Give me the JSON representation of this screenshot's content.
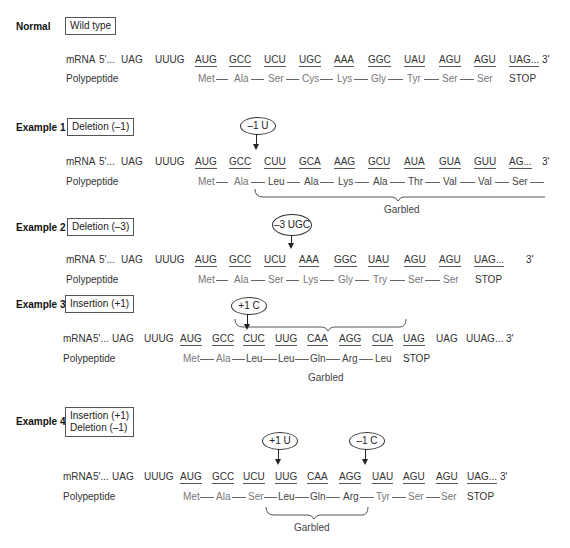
{
  "sections": {
    "normal": {
      "label": "Normal",
      "type": "Wild type",
      "mrna_label": "mRNA",
      "five_prime": "5'...",
      "pre": [
        "UAG",
        "UUUG"
      ],
      "codons": [
        "AUG",
        "GCC",
        "UCU",
        "UGC",
        "AAA",
        "GGC",
        "UAU",
        "AGU",
        "AGU",
        "UAG..."
      ],
      "three_prime": "3'",
      "peptide_label": "Polypeptide",
      "amino_acids": [
        "Met",
        "Ala",
        "Ser",
        "Cys",
        "Lys",
        "Gly",
        "Tyr",
        "Ser",
        "Ser"
      ],
      "stop": "STOP"
    },
    "example1": {
      "label": "Example 1",
      "type": "Deletion (–1)",
      "mutation": "–1 U",
      "mrna_label": "mRNA",
      "five_prime": "5'...",
      "pre": [
        "UAG",
        "UUUG"
      ],
      "codons": [
        "AUG",
        "GCC",
        "CUU",
        "GCA",
        "AAG",
        "GCU",
        "AUA",
        "GUA",
        "GUU",
        "AG..."
      ],
      "three_prime": "3'",
      "peptide_label": "Polypeptide",
      "amino_acids": [
        "Met",
        "Ala",
        "Leu",
        "Ala",
        "Lys",
        "Ala",
        "Thr",
        "Val",
        "Val",
        "Ser"
      ],
      "garbled": "Garbled"
    },
    "example2": {
      "label": "Example 2",
      "type": "Deletion (–3)",
      "mutation": "–3 UGC",
      "mrna_label": "mRNA",
      "five_prime": "5'...",
      "pre": [
        "UAG",
        "UUUG"
      ],
      "codons": [
        "AUG",
        "GCC",
        "UCU",
        "AAA",
        "GGC",
        "UAU",
        "AGU",
        "AGU",
        "UAG..."
      ],
      "three_prime": "3'",
      "peptide_label": "Polypeptide",
      "amino_acids": [
        "Met",
        "Ala",
        "Ser",
        "Lys",
        "Gly",
        "Try",
        "Ser",
        "Ser"
      ],
      "stop": "STOP"
    },
    "example3": {
      "label": "Example 3",
      "type": "Insertion (+1)",
      "mutation": "+1 C",
      "mrna_label": "mRNA",
      "five_prime": "5'...",
      "pre": [
        "UAG",
        "UUUG"
      ],
      "codons": [
        "AUG",
        "GCC",
        "CUC",
        "UUG",
        "CAA",
        "AGG",
        "CUA",
        "UAG"
      ],
      "post": [
        "UAG",
        "UUAG..."
      ],
      "three_prime": "3'",
      "peptide_label": "Polypeptide",
      "amino_acids": [
        "Met",
        "Ala",
        "Leu",
        "Leu",
        "Gln",
        "Arg",
        "Leu"
      ],
      "stop": "STOP",
      "garbled": "Garbled"
    },
    "example4": {
      "label": "Example 4",
      "type_line1": "Insertion (+1)",
      "type_line2": "Deletion (–1)",
      "mutation1": "+1 U",
      "mutation2": "–1 C",
      "mrna_label": "mRNA",
      "five_prime": "5'...",
      "pre": [
        "UAG",
        "UUUG"
      ],
      "codons": [
        "AUG",
        "GCC",
        "UCU",
        "UUG",
        "CAA",
        "AGG",
        "UAU",
        "AGU",
        "AGU",
        "UAG..."
      ],
      "three_prime": "3'",
      "peptide_label": "Polypeptide",
      "amino_acids": [
        "Met",
        "Ala",
        "Ser",
        "Leu",
        "Gln",
        "Arg",
        "Tyr",
        "Ser",
        "Ser"
      ],
      "stop": "STOP",
      "garbled": "Garbled"
    }
  }
}
